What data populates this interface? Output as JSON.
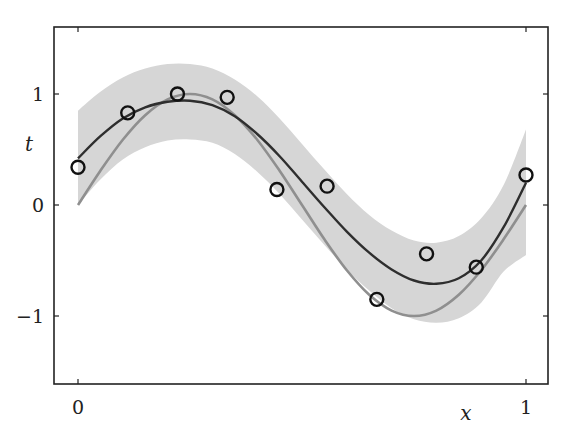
{
  "chart_data": {
    "type": "line",
    "title": "",
    "xlabel": "x",
    "ylabel": "t",
    "xlim": [
      -0.05,
      1.05
    ],
    "ylim": [
      -1.6,
      1.6
    ],
    "grid": false,
    "legend": null,
    "x_ticks": [
      0,
      1
    ],
    "x_tick_labels": [
      "0",
      "1"
    ],
    "y_ticks": [
      -1,
      0,
      1
    ],
    "y_tick_labels": [
      "−1",
      "0",
      "1"
    ],
    "colors": {
      "band": "#d6d6d6",
      "mean_curve": "#2e2e2e",
      "true_curve": "#8f8f8f",
      "points": "#111111",
      "axes": "#222222"
    },
    "series": [
      {
        "name": "observations",
        "kind": "scatter-open-circles",
        "x": [
          0.0,
          0.111,
          0.222,
          0.333,
          0.444,
          0.556,
          0.667,
          0.778,
          0.889,
          1.0
        ],
        "y": [
          0.34,
          0.83,
          1.0,
          0.97,
          0.14,
          0.17,
          -0.85,
          -0.44,
          -0.56,
          0.27
        ]
      },
      {
        "name": "true function sin(2πx)",
        "kind": "line",
        "x": [
          0.0,
          0.05,
          0.1,
          0.15,
          0.2,
          0.25,
          0.3,
          0.35,
          0.4,
          0.45,
          0.5,
          0.55,
          0.6,
          0.65,
          0.7,
          0.75,
          0.8,
          0.85,
          0.9,
          0.95,
          1.0
        ],
        "y": [
          0.0,
          0.309,
          0.588,
          0.809,
          0.951,
          1.0,
          0.951,
          0.809,
          0.588,
          0.309,
          0.0,
          -0.309,
          -0.588,
          -0.809,
          -0.951,
          -1.0,
          -0.951,
          -0.809,
          -0.588,
          -0.309,
          0.0
        ]
      },
      {
        "name": "predictive mean",
        "kind": "line",
        "x": [
          0.0,
          0.05,
          0.1,
          0.15,
          0.2,
          0.25,
          0.3,
          0.35,
          0.4,
          0.45,
          0.5,
          0.55,
          0.6,
          0.65,
          0.7,
          0.75,
          0.8,
          0.85,
          0.9,
          0.95,
          1.0
        ],
        "y": [
          0.42,
          0.62,
          0.78,
          0.88,
          0.93,
          0.94,
          0.9,
          0.8,
          0.64,
          0.44,
          0.21,
          -0.02,
          -0.24,
          -0.43,
          -0.58,
          -0.68,
          -0.71,
          -0.66,
          -0.5,
          -0.2,
          0.2
        ]
      },
      {
        "name": "predictive band upper",
        "kind": "band-upper",
        "x": [
          0.0,
          0.05,
          0.1,
          0.15,
          0.2,
          0.25,
          0.3,
          0.35,
          0.4,
          0.45,
          0.5,
          0.55,
          0.6,
          0.65,
          0.7,
          0.75,
          0.8,
          0.85,
          0.9,
          0.95,
          1.0
        ],
        "y": [
          0.85,
          1.02,
          1.15,
          1.23,
          1.27,
          1.27,
          1.23,
          1.13,
          0.98,
          0.78,
          0.55,
          0.32,
          0.1,
          -0.09,
          -0.23,
          -0.32,
          -0.34,
          -0.28,
          -0.12,
          0.18,
          0.68
        ]
      },
      {
        "name": "predictive band lower",
        "kind": "band-lower",
        "x": [
          0.0,
          0.05,
          0.1,
          0.15,
          0.2,
          0.25,
          0.3,
          0.35,
          0.4,
          0.45,
          0.5,
          0.55,
          0.6,
          0.65,
          0.7,
          0.75,
          0.8,
          0.85,
          0.9,
          0.95,
          1.0
        ],
        "y": [
          0.0,
          0.23,
          0.41,
          0.52,
          0.58,
          0.59,
          0.56,
          0.46,
          0.3,
          0.1,
          -0.13,
          -0.36,
          -0.58,
          -0.77,
          -0.93,
          -1.03,
          -1.06,
          -1.02,
          -0.88,
          -0.6,
          -0.45
        ]
      }
    ]
  },
  "layout": {
    "frame": {
      "left": 54,
      "top": 27,
      "right": 548,
      "bottom": 384
    },
    "x0_px": 78,
    "x1_px": 526,
    "y0_px": 205,
    "y_unit_px": 111
  }
}
